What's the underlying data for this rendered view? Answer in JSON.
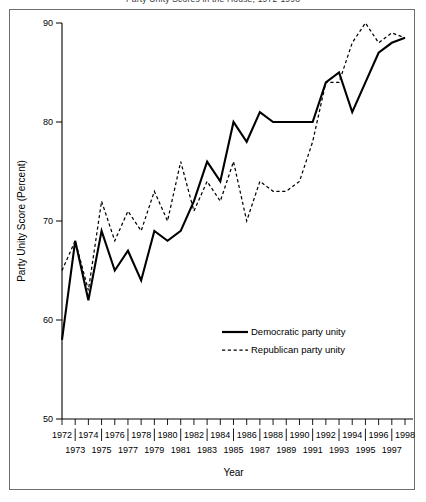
{
  "figure": {
    "clipped_title": "Party Unity Scores in the House, 1972-1998",
    "frame_color": "#6e6e6e",
    "background": "#ffffff"
  },
  "chart_data": {
    "type": "line",
    "title": "",
    "xlabel": "Year",
    "ylabel": "Party Unity Score (Percent)",
    "ylim": [
      50,
      90
    ],
    "xlim": [
      1972,
      1998
    ],
    "yticks": [
      50,
      60,
      70,
      80,
      90
    ],
    "ytick_labels": [
      "50",
      "60",
      "70",
      "80",
      "90"
    ],
    "grid": false,
    "legend_position": "center-right-inside",
    "x": [
      1972,
      1973,
      1974,
      1975,
      1976,
      1977,
      1978,
      1979,
      1980,
      1981,
      1982,
      1983,
      1984,
      1985,
      1986,
      1987,
      1988,
      1989,
      1990,
      1991,
      1992,
      1993,
      1994,
      1995,
      1996,
      1997,
      1998
    ],
    "xtick_labels_top_row": [
      "1972",
      "1974",
      "1976",
      "1978",
      "1980",
      "1982",
      "1984",
      "1986",
      "1988",
      "1990",
      "1992",
      "1994",
      "1996",
      "1998"
    ],
    "xtick_labels_bottom_row": [
      "1973",
      "1975",
      "1977",
      "1979",
      "1981",
      "1983",
      "1985",
      "1987",
      "1989",
      "1991",
      "1993",
      "1995",
      "1997"
    ],
    "series": [
      {
        "name": "Democratic party unity",
        "style": "solid",
        "color": "#000000",
        "values": [
          58,
          68,
          62,
          69,
          65,
          67,
          64,
          69,
          68,
          69,
          72,
          76,
          74,
          80,
          78,
          81,
          80,
          80,
          80,
          80,
          84,
          85,
          81,
          84,
          87,
          88,
          88.5
        ]
      },
      {
        "name": "Republican party unity",
        "style": "dashed",
        "color": "#000000",
        "values": [
          65,
          68,
          63,
          72,
          68,
          71,
          69,
          73,
          70,
          76,
          71,
          74,
          72,
          76,
          70,
          74,
          73,
          73,
          74,
          78,
          84,
          84,
          88,
          90,
          88,
          89,
          88.5
        ]
      }
    ]
  },
  "legend": {
    "items": [
      {
        "label": "Democratic party unity",
        "style": "solid"
      },
      {
        "label": "Republican party unity",
        "style": "dashed"
      }
    ]
  }
}
